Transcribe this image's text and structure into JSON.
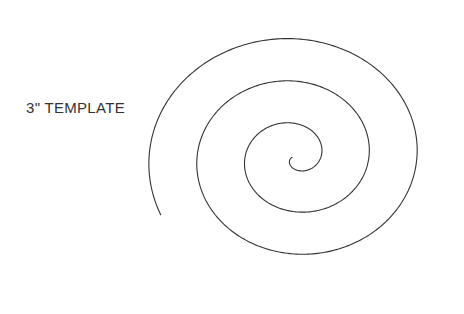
{
  "canvas": {
    "width": 464,
    "height": 314,
    "background_color": "#ffffff"
  },
  "label": {
    "text": "3\" TEMPLATE",
    "color": "#333333",
    "font_size_px": 15,
    "x": 26,
    "y": 99
  },
  "spiral": {
    "name": "spiral-template-outline",
    "stroke_color": "#333333",
    "stroke_width": 1.1,
    "fill": "none",
    "center_x": 295,
    "center_y": 157,
    "turns": 3.05,
    "start_radius": 3,
    "radius_step_x": 48,
    "radius_step_y": 45,
    "ellipse_ratio_x": 1.0,
    "ellipse_ratio_y": 0.94,
    "start_angle_deg": 172,
    "direction": "counterclockwise",
    "bounds": {
      "left": 150,
      "top": 22,
      "right": 438,
      "bottom": 289
    },
    "inner_tip": {
      "x": 293,
      "y": 152
    },
    "outer_tip": {
      "x": 437,
      "y": 148
    }
  }
}
